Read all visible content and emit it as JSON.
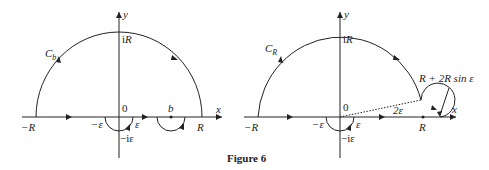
{
  "caption": "Figure 6",
  "left_diagram": {
    "contour_label": "C",
    "contour_sub": "b",
    "x_axis": "x",
    "y_axis": "y",
    "origin": "0",
    "top": "iR",
    "neg_R": "−R",
    "pos_R": "R",
    "neg_eps": "−ε",
    "pos_eps": "ε",
    "neg_i_eps": "−iε",
    "point_b": "b"
  },
  "right_diagram": {
    "contour_label": "C",
    "contour_sub": "R",
    "x_axis": "x",
    "y_axis": "y",
    "origin": "0",
    "top": "iR",
    "neg_R": "−R",
    "point_R": "R",
    "neg_eps": "−ε",
    "pos_eps": "ε",
    "neg_i_eps": "−iε",
    "angle": "2ε",
    "annotation": "R + 2R sin ε"
  }
}
